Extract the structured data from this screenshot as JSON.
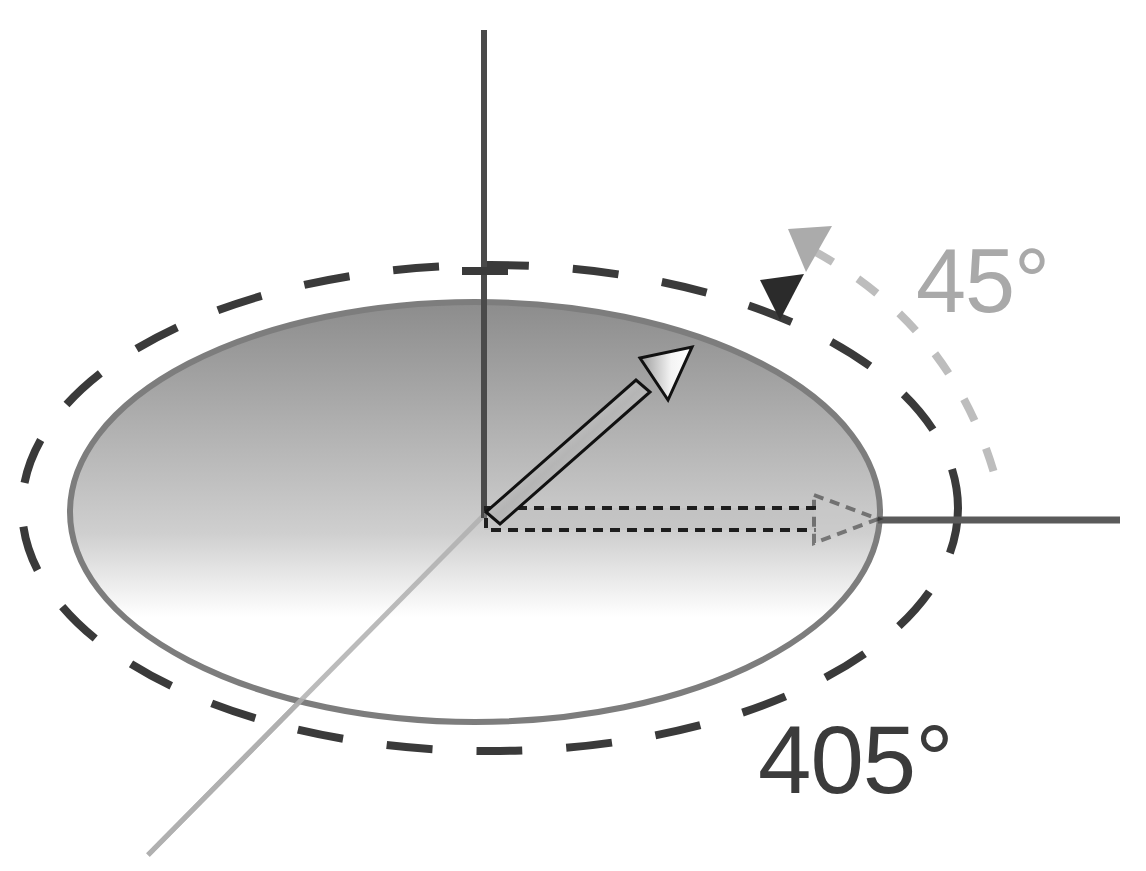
{
  "diagram": {
    "labels": {
      "small_angle": "45°",
      "total_angle": "405°"
    },
    "colors": {
      "axis_dark": "#4a4a4a",
      "axis_light": "#b0b0b0",
      "ellipse_stroke": "#7d7d7d",
      "ellipse_fill_top": "#8f8f8f",
      "ellipse_fill_bottom": "#ffffff",
      "dashed_outer": "#3a3a3a",
      "dashed_small_arc": "#bdbdbd",
      "label_45": "#a9a9a9",
      "label_405": "#3b3b3b",
      "arrow_outline": "#111111"
    },
    "elements": [
      {
        "name": "vertical-axis",
        "from": [
          484,
          30
        ],
        "to": [
          484,
          515
        ]
      },
      {
        "name": "horizontal-axis",
        "from": [
          484,
          520
        ],
        "to": [
          1120,
          520
        ]
      },
      {
        "name": "depth-axis",
        "from": [
          484,
          515
        ],
        "to": [
          148,
          855
        ]
      },
      {
        "name": "disk-ellipse",
        "center": [
          475,
          512
        ],
        "rx": 405,
        "ry": 210
      },
      {
        "name": "outer-dashed-ellipse",
        "center": [
          490,
          510
        ],
        "rx": 470,
        "ry": 245
      },
      {
        "name": "rotated-vector-arrow",
        "from": [
          490,
          515
        ],
        "to": [
          690,
          350
        ],
        "angle_deg": 45
      },
      {
        "name": "reference-vector-arrow-dashed",
        "from": [
          484,
          520
        ],
        "to": [
          880,
          520
        ]
      }
    ]
  }
}
